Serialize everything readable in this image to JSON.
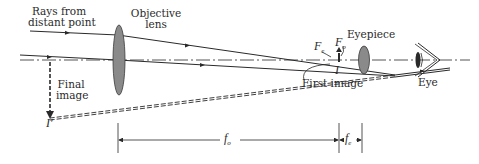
{
  "diagram": {
    "labels": {
      "rays_line1": "Rays from",
      "rays_line2": "distant point",
      "objective_line1": "Objective",
      "objective_line2": "lens",
      "eyepiece": "Eyepiece",
      "fe_focal_point": "F",
      "fe_sub": "e",
      "fo_focal_point": "F",
      "fo_sub": "o",
      "first_image_marker": "I",
      "first_image": "First image",
      "final_image_line1": "Final",
      "final_image_line2": "image",
      "final_image_marker": "I′",
      "eye": "Eye",
      "fo_dimension": "f",
      "fo_dimension_sub": "o",
      "fe_dimension": "f",
      "fe_dimension_sub": "e"
    },
    "colors": {
      "line": "#2a2a2a",
      "lens_fill": "#8a8a8a",
      "lens_stroke": "#3a3a3a",
      "background": "#ffffff"
    }
  }
}
